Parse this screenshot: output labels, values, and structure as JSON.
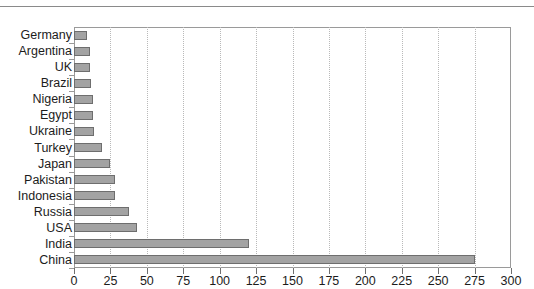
{
  "chart_data": {
    "type": "bar",
    "orientation": "horizontal",
    "title": "",
    "xlabel": "",
    "ylabel": "",
    "xlim": [
      0,
      300
    ],
    "ylim": null,
    "xticks": [
      0,
      25,
      50,
      75,
      100,
      125,
      150,
      175,
      200,
      225,
      250,
      275,
      300
    ],
    "grid": "vertical-dotted",
    "legend": "none",
    "bar_fill_color": "#a3a3a3",
    "bar_border_color": "#6e6e6e",
    "gridline_color": "#b9b9b9",
    "axis_color": "#9a9a9a",
    "categories": [
      "Germany",
      "Argentina",
      "UK",
      "Brazil",
      "Nigeria",
      "Egypt",
      "Ukraine",
      "Turkey",
      "Japan",
      "Pakistan",
      "Indonesia",
      "Russia",
      "USA",
      "India",
      "China"
    ],
    "values": [
      9,
      11,
      11,
      12,
      13,
      13,
      14,
      19,
      25,
      28,
      28,
      38,
      43,
      120,
      275
    ]
  }
}
